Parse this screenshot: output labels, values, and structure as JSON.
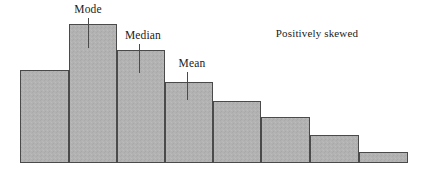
{
  "figure": {
    "title": "",
    "background_color": "#ffffff"
  },
  "annotations": {
    "mode": "Mode",
    "median": "Median",
    "mean": "Mean",
    "skew_note": "Positively skewed"
  },
  "style": {
    "bar_fill": "#b0b0b0",
    "bar_stroke": "#4a4a4a",
    "text_color": "#1b1b1b",
    "leader_line_color": "#4a4a4a"
  },
  "chart_data": {
    "type": "bar",
    "title": "",
    "subtitle": "",
    "xlabel": "",
    "ylabel": "",
    "grid": false,
    "legend": false,
    "categories": [
      "1",
      "2",
      "3",
      "4",
      "5",
      "6",
      "7",
      "8"
    ],
    "values": [
      93,
      139,
      113,
      81,
      62,
      46,
      28,
      11
    ],
    "ylim": [
      0,
      145
    ],
    "xlim": [
      0,
      8
    ],
    "bar_edges_px": [
      20,
      69,
      117,
      165,
      213,
      261,
      310,
      359,
      408
    ],
    "bar_tops_px": [
      70,
      24,
      50,
      82,
      101,
      117,
      135,
      152
    ],
    "baseline_px": 163,
    "markers": [
      {
        "name": "Mode",
        "x_px": 88,
        "label_y_px": 18,
        "tick_bottom_px": 48
      },
      {
        "name": "Median",
        "x_px": 139,
        "label_y_px": 44,
        "tick_bottom_px": 73
      },
      {
        "name": "Mean",
        "x_px": 187,
        "label_y_px": 72,
        "tick_bottom_px": 100
      }
    ],
    "annotation_texts": [
      "Mode",
      "Median",
      "Mean",
      "Positively skewed"
    ]
  }
}
